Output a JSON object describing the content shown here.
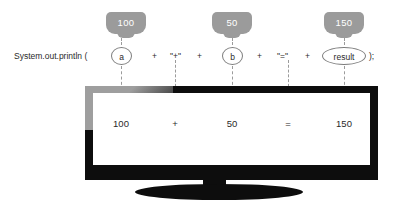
{
  "code": {
    "prefix": "System.out.println (",
    "suffix": ");",
    "plus1": "+",
    "plus2": "+",
    "plus3": "+",
    "plus4": "+",
    "literal_plus": "\"+\"",
    "literal_equals": "\"=\"",
    "var_a": "a",
    "var_b": "b",
    "var_result": "result"
  },
  "badges": [
    {
      "label": "100",
      "name": "badge-value-a"
    },
    {
      "label": "50",
      "name": "badge-value-b"
    },
    {
      "label": "150",
      "name": "badge-value-result"
    }
  ],
  "console_output": {
    "value_a": "100",
    "operator_plus": "+",
    "value_b": "50",
    "operator_equals": "=",
    "value_result": "150",
    "full_line": "100 + 50 = 150"
  },
  "colors": {
    "badge_gray": "#9b9b9b",
    "monitor_black": "#0d0d0d",
    "bezel_highlight": "#9e9e9e",
    "screen_white": "#ffffff",
    "text_dark": "#2a2a2a",
    "dashed_line": "#9b9b9b"
  }
}
